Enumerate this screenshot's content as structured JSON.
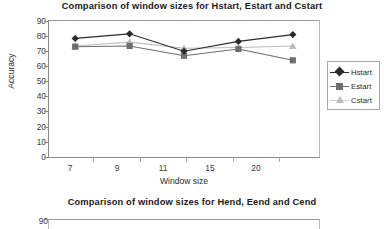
{
  "chart_data": [
    {
      "type": "line",
      "title": "Comparison of window sizes for Hstart, Estart and Cstart",
      "xlabel": "Window size",
      "ylabel": "Accuracy",
      "categories": [
        "7",
        "9",
        "11",
        "15",
        "20"
      ],
      "ylim": [
        0,
        90
      ],
      "yticks": [
        "0",
        "10",
        "20",
        "30",
        "40",
        "50",
        "60",
        "70",
        "80",
        "90"
      ],
      "grid": false,
      "legend_position": "right",
      "series": [
        {
          "name": "Hstart",
          "marker": "diamond",
          "color": "#2b2b2b",
          "values": [
            78.5,
            81.5,
            70.0,
            76.5,
            81.0
          ]
        },
        {
          "name": "Estart",
          "marker": "square",
          "color": "#6e6e6e",
          "values": [
            73.0,
            73.5,
            67.0,
            71.5,
            64.0
          ]
        },
        {
          "name": "Cstart",
          "marker": "triangle",
          "color": "#bdbdbd",
          "values": [
            73.5,
            76.0,
            72.0,
            72.5,
            73.5
          ]
        }
      ]
    },
    {
      "type": "line",
      "title": "Comparison of window sizes for Hend, Eend and Cend",
      "ylim": [
        0,
        90
      ],
      "yticks_visible": [
        "90"
      ],
      "truncated": true
    }
  ],
  "chart1": {
    "title": "Comparison of window sizes for Hstart, Estart and Cstart",
    "ylabel": "Accuracy",
    "xlabel": "Window size",
    "yticks": [
      "90",
      "80",
      "70",
      "60",
      "50",
      "40",
      "30",
      "20",
      "10",
      "0"
    ],
    "xticks": [
      "7",
      "9",
      "11",
      "15",
      "20"
    ],
    "legend": [
      {
        "label": "Hstart",
        "color": "#2b2b2b",
        "marker": "diamond"
      },
      {
        "label": "Estart",
        "color": "#6e6e6e",
        "marker": "square"
      },
      {
        "label": "Cstart",
        "color": "#bdbdbd",
        "marker": "triangle"
      }
    ]
  },
  "chart2": {
    "title": "Comparison of window sizes for Hend, Eend and Cend",
    "ytick_top": "90"
  }
}
